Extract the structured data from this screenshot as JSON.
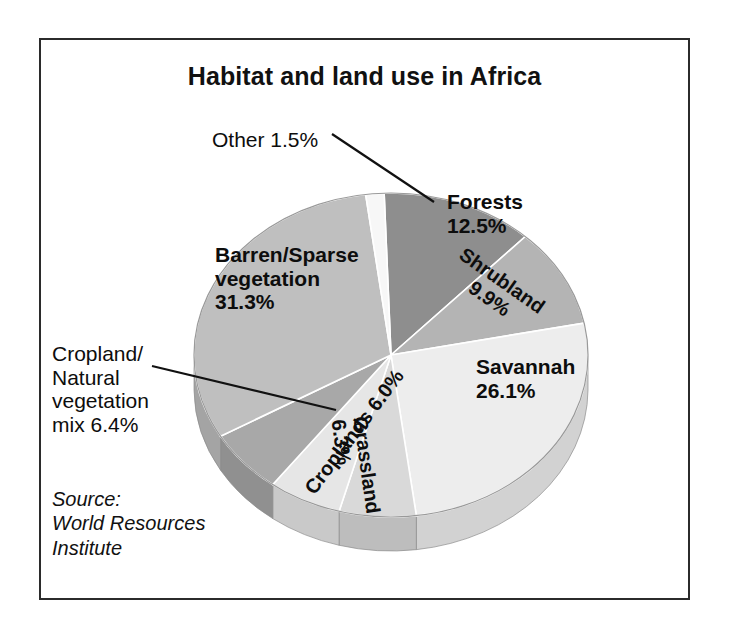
{
  "figure": {
    "title": "Habitat and land use in Africa",
    "source_note": "Source:\nWorld Resources\nInstitute",
    "frame_color": "#2b2b2b",
    "background": "#ffffff"
  },
  "labels": {
    "other": "Other 1.5%",
    "forests": "Forests\n12.5%",
    "shrubland": "Shrubland\n9.9%",
    "savannah": "Savannah\n26.1%",
    "grassland": "Grassland\n6.3%",
    "croplands": "Croplands 6.0%",
    "barren": "Barren/Sparse\nvegetation\n31.3%",
    "cropland_mix": "Cropland/\nNatural\nvegetation\nmix 6.4%"
  },
  "chart_data": {
    "type": "pie",
    "title": "Habitat and land use in Africa",
    "subtitle": "",
    "xlabel": "",
    "ylabel": "",
    "source": "World Resources Institute",
    "three_d": true,
    "start_angle_deg": -2,
    "direction": "clockwise",
    "units": "percent",
    "total": 100.0,
    "legend_position": "none (labels on slices)",
    "categories": [
      "Forests",
      "Shrubland",
      "Savannah",
      "Grassland",
      "Croplands",
      "Cropland/Natural vegetation mix",
      "Barren/Sparse vegetation",
      "Other"
    ],
    "values": [
      12.5,
      9.9,
      26.1,
      6.3,
      6.0,
      6.4,
      31.3,
      1.5
    ],
    "slices": [
      {
        "label": "Forests",
        "value": 12.5,
        "display": "12.5%",
        "color": "#8e8e8e",
        "side_color": "#777777",
        "label_placement": "inside"
      },
      {
        "label": "Shrubland",
        "value": 9.9,
        "display": "9.9%",
        "color": "#b4b4b4",
        "side_color": "#9b9b9b",
        "label_placement": "inside-rotated"
      },
      {
        "label": "Savannah",
        "value": 26.1,
        "display": "26.1%",
        "color": "#ededed",
        "side_color": "#d2d2d2",
        "label_placement": "inside"
      },
      {
        "label": "Grassland",
        "value": 6.3,
        "display": "6.3%",
        "color": "#d9d9d9",
        "side_color": "#bdbdbd",
        "label_placement": "inside-rotated"
      },
      {
        "label": "Croplands",
        "value": 6.0,
        "display": "6.0%",
        "color": "#e6e6e6",
        "side_color": "#c9c9c9",
        "label_placement": "inside-rotated"
      },
      {
        "label": "Cropland/Natural vegetation mix",
        "value": 6.4,
        "display": "6.4%",
        "color": "#a8a8a8",
        "side_color": "#909090",
        "label_placement": "callout-left"
      },
      {
        "label": "Barren/Sparse vegetation",
        "value": 31.3,
        "display": "31.3%",
        "color": "#bfbfbf",
        "side_color": "#a4a4a4",
        "label_placement": "inside"
      },
      {
        "label": "Other",
        "value": 1.5,
        "display": "1.5%",
        "color": "#f7f7f7",
        "side_color": "#dddddd",
        "label_placement": "callout-top"
      }
    ]
  }
}
